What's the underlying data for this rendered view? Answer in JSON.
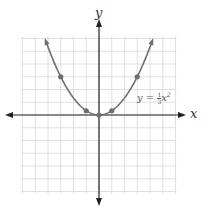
{
  "chart_data": {
    "type": "line",
    "title": "",
    "xlabel": "x",
    "ylabel": "y",
    "xlim": [
      -6,
      6
    ],
    "ylim": [
      -6,
      6
    ],
    "grid": true,
    "equation_label": {
      "lhs": "y = ",
      "frac_num": "1",
      "frac_den": "3",
      "var": "x",
      "exp": "2"
    },
    "series": [
      {
        "name": "y = (1/3)x^2",
        "function": "x^2/3",
        "x_range": [
          -4.15,
          4.15
        ],
        "color": "#666666"
      }
    ],
    "points": [
      {
        "x": -3,
        "y": 3
      },
      {
        "x": -1,
        "y": 0.333
      },
      {
        "x": 0,
        "y": 0
      },
      {
        "x": 1,
        "y": 0.333
      },
      {
        "x": 3,
        "y": 3
      }
    ]
  },
  "labels": {
    "x_axis": "x",
    "y_axis": "y"
  },
  "colors": {
    "grid": "#d8d8d8",
    "axis": "#222222",
    "curve": "#6e6e6e",
    "point": "#6e6e6e"
  }
}
